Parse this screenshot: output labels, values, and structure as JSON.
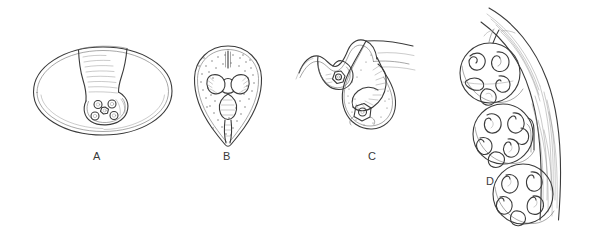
{
  "figure": {
    "background_color": "#ffffff",
    "ink_color": "#4a4a4a",
    "medium": "pen-and-ink scientific illustration",
    "width": 605,
    "height": 228,
    "panel_count": 4
  },
  "panels": [
    {
      "id": "A",
      "label": "A",
      "label_x": 96,
      "label_y": 155,
      "description": "Oval cyst with double outer membrane containing an invaginated inner sac bearing a rosette of small suckers and hooks",
      "shape": "ellipse",
      "suckers": 5
    },
    {
      "id": "B",
      "label": "B",
      "label_x": 226,
      "label_y": 155,
      "description": "Pear-shaped cyst with double wall, stippled interior, two lateral lobed suckers and a central body with narrow caudal stalk",
      "shape": "pyriform",
      "suckers": 2
    },
    {
      "id": "C",
      "label": "C",
      "label_x": 371,
      "label_y": 155,
      "description": "Wavy membrane with two downward invaginated pouches; larger pouch holds a segmented coiled body and a rosette sucker",
      "shape": "invaginated-pouches",
      "pouches": 2
    },
    {
      "id": "D",
      "label": "D",
      "label_x": 489,
      "label_y": 180,
      "description": "Three brood capsules attached to a curved hatched cyst wall, each containing several comma-shaped protoscolices",
      "shape": "brood-capsules",
      "capsules": 3,
      "protoscolices_per_capsule": [
        5,
        6,
        5
      ]
    }
  ]
}
